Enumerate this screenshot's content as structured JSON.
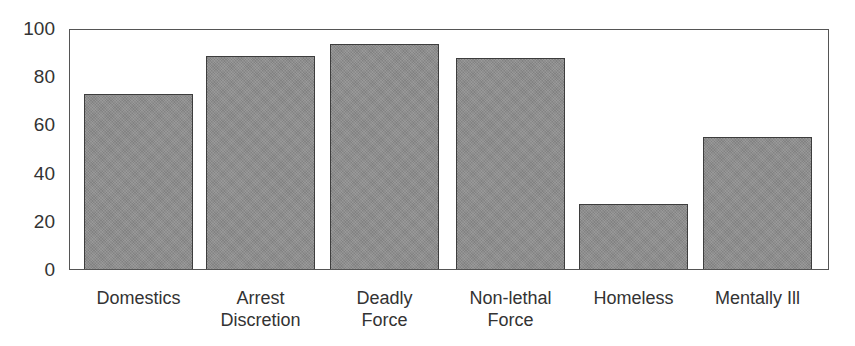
{
  "chart_data": {
    "type": "bar",
    "title": "",
    "xlabel": "",
    "ylabel": "",
    "categories": [
      "Domestics",
      "Arrest Discretion",
      "Deadly Force",
      "Non-lethal Force",
      "Homeless",
      "Mentally Ill"
    ],
    "category_labels": [
      "Domestics",
      "Arrest\nDiscretion",
      "Deadly\nForce",
      "Non-lethal\nForce",
      "Homeless",
      "Mentally Ill"
    ],
    "values": [
      73,
      89,
      94,
      88,
      27,
      55
    ],
    "ylim": [
      0,
      100
    ],
    "yticks": [
      0,
      20,
      40,
      60,
      80,
      100
    ],
    "grid": false,
    "legend": null,
    "colors": {
      "bar_fill": "#8d8d8d",
      "bar_edge": "#3d3d3d",
      "frame": "#555555",
      "text": "#333333"
    }
  }
}
